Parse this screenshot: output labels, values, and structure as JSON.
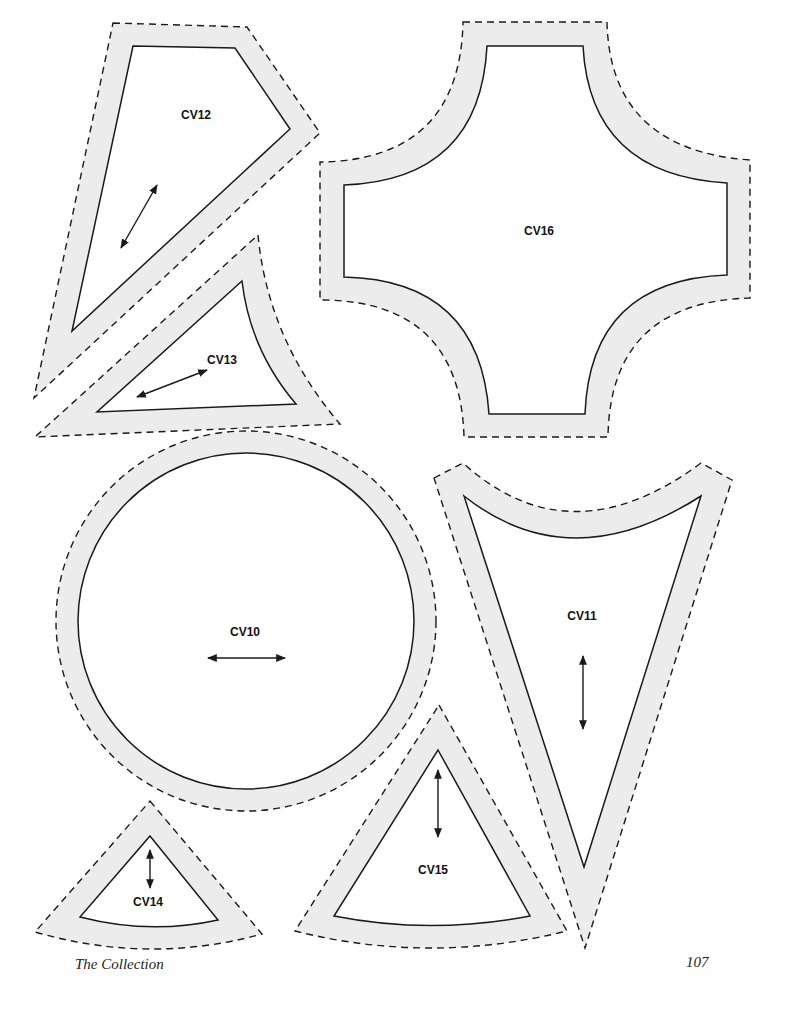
{
  "page": {
    "footer_title": "The Collection",
    "page_number": "107",
    "colors": {
      "seam_allowance_fill": "#ececec",
      "line": "#1a1a1a",
      "background": "#ffffff"
    }
  },
  "templates": [
    {
      "id": "CV12",
      "label": "CV12",
      "shape": "quadrilateral kite",
      "grain": "diagonal"
    },
    {
      "id": "CV13",
      "label": "CV13",
      "shape": "curved triangle",
      "grain": "diagonal"
    },
    {
      "id": "CV16",
      "label": "CV16",
      "shape": "curved cross",
      "grain": "none"
    },
    {
      "id": "CV10",
      "label": "CV10",
      "shape": "circle",
      "grain": "horizontal"
    },
    {
      "id": "CV11",
      "label": "CV11",
      "shape": "curved-top triangle",
      "grain": "vertical"
    },
    {
      "id": "CV14",
      "label": "CV14",
      "shape": "wedge",
      "grain": "vertical"
    },
    {
      "id": "CV15",
      "label": "CV15",
      "shape": "wedge",
      "grain": "vertical"
    }
  ],
  "legend": {
    "dashed_line": "seam line (outer cutting edge)",
    "solid_line": "finished sewing line",
    "double_arrow": "grain line"
  }
}
